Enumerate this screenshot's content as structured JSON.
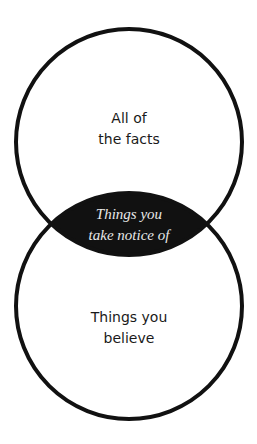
{
  "diagram": {
    "type": "venn",
    "colors": {
      "stroke": "#111111",
      "intersection_fill": "#111111",
      "background": "#ffffff",
      "text_dark": "#1a1a1a",
      "text_light": "#e8e8e8"
    },
    "top_circle": {
      "label_line1": "All of",
      "label_line2": "the facts"
    },
    "bottom_circle": {
      "label_line1": "Things you",
      "label_line2": "believe"
    },
    "intersection": {
      "label_line1": "Things you",
      "label_line2": "take notice of"
    }
  }
}
